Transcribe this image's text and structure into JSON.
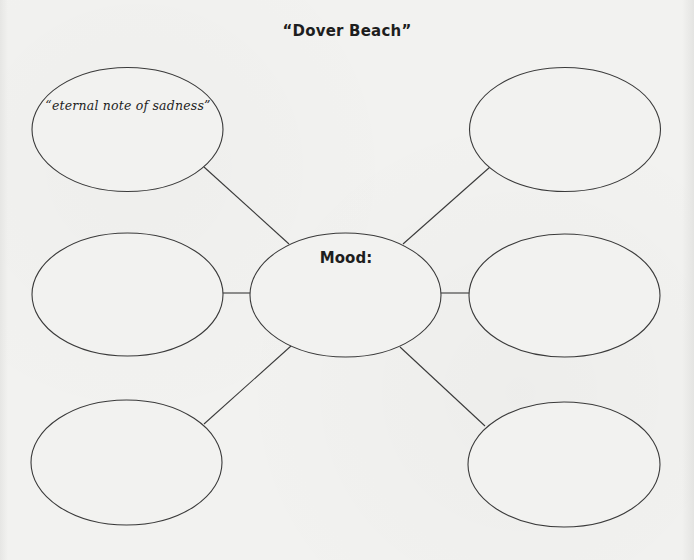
{
  "title": "“Dover Beach”",
  "center_node": {
    "label": "Mood:",
    "text": ""
  },
  "nodes": [
    {
      "position": "top-left",
      "text": "“eternal note of sadness”"
    },
    {
      "position": "top-right",
      "text": ""
    },
    {
      "position": "middle-left",
      "text": ""
    },
    {
      "position": "middle-right",
      "text": ""
    },
    {
      "position": "bottom-left",
      "text": ""
    },
    {
      "position": "bottom-right",
      "text": ""
    }
  ],
  "colors": {
    "background": "#f2f2f0",
    "stroke": "#3a3a3a",
    "text": "#1e1e1e"
  }
}
